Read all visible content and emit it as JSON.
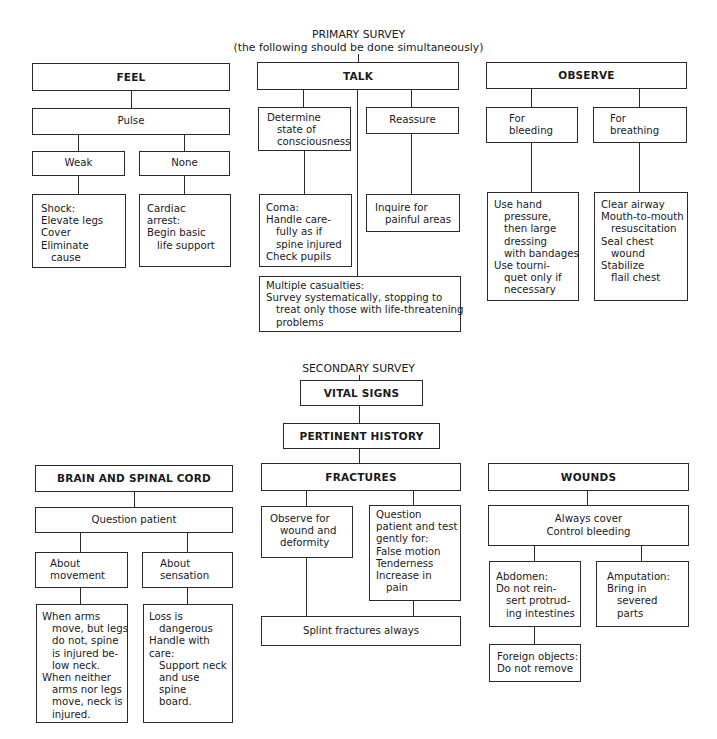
{
  "primary": {
    "title": "PRIMARY SURVEY",
    "subtitle": "(the following should be done simultaneously)",
    "feel": {
      "label": "FEEL",
      "pulse": "Pulse",
      "weak": "Weak",
      "none": "None",
      "shock": [
        "Shock:",
        "Elevate legs",
        "Cover",
        "Eliminate",
        "cause"
      ],
      "cardiac": [
        "Cardiac",
        "arrest:",
        "Begin basic",
        "life support"
      ]
    },
    "talk": {
      "label": "TALK",
      "determine": [
        "Determine",
        "state of",
        "consciousness"
      ],
      "reassure": "Reassure",
      "coma": [
        "Coma:",
        "Handle care-",
        "fully as if",
        "spine injured",
        "Check pupils"
      ],
      "inquire": [
        "Inquire for",
        "painful areas"
      ],
      "multiple": [
        "Multiple casualties:",
        "Survey systematically, stopping to",
        "treat only those with life-threatening",
        "problems"
      ]
    },
    "observe": {
      "label": "OBSERVE",
      "bleeding": [
        "For",
        "bleeding"
      ],
      "breathing": [
        "For",
        "breathing"
      ],
      "bleeding_actions": [
        "Use hand",
        "pressure,",
        "then large",
        "dressing",
        "with bandages",
        "Use tourni-",
        "quet only if",
        "necessary"
      ],
      "breathing_actions": [
        "Clear airway",
        "Mouth-to-mouth",
        "resuscitation",
        "Seal chest",
        "wound",
        "Stabilize",
        "flail chest"
      ]
    }
  },
  "secondary": {
    "title": "SECONDARY SURVEY",
    "vital_signs": "VITAL SIGNS",
    "pertinent_history": "PERTINENT HISTORY",
    "brain": {
      "label": "BRAIN AND SPINAL CORD",
      "question": "Question patient",
      "movement": [
        "About",
        "movement"
      ],
      "sensation": [
        "About",
        "sensation"
      ],
      "movement_detail": [
        "When arms",
        "move, but legs",
        "do not, spine",
        "is injured be-",
        "low neck.",
        "When neither",
        "arms nor legs",
        "move, neck is",
        "injured."
      ],
      "sensation_detail": [
        "Loss is",
        "dangerous",
        "Handle with",
        "care:",
        "Support neck",
        "and use",
        "spine",
        "board."
      ]
    },
    "fractures": {
      "label": "FRACTURES",
      "observe": [
        "Observe for",
        "wound and",
        "deformity"
      ],
      "question": [
        "Question",
        "patient and test",
        "gently for:",
        "False motion",
        "Tenderness",
        "Increase in",
        "pain"
      ],
      "splint": "Splint fractures always"
    },
    "wounds": {
      "label": "WOUNDS",
      "always": [
        "Always cover",
        "Control bleeding"
      ],
      "abdomen": [
        "Abdomen:",
        "Do not rein-",
        "sert protrud-",
        "ing intestines"
      ],
      "amputation": [
        "Amputation:",
        "Bring in",
        "severed",
        "parts"
      ],
      "foreign": [
        "Foreign objects:",
        "Do not remove"
      ]
    }
  }
}
